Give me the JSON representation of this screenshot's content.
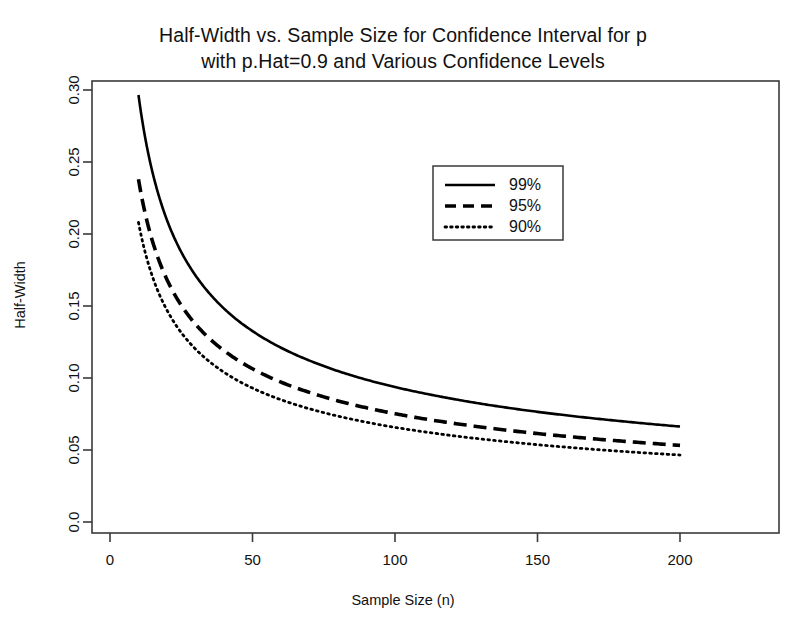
{
  "chart_data": {
    "type": "line",
    "title_line1": "Half-Width vs. Sample Size for Confidence Interval for p",
    "title_line2": "with p.Hat=0.9 and Various Confidence Levels",
    "xlabel": "Sample Size (n)",
    "ylabel": "Half-Width",
    "xlim": [
      0,
      210
    ],
    "ylim": [
      0.0,
      0.31
    ],
    "grid": false,
    "legend_position": "top-center-right",
    "xticks": [
      0,
      50,
      100,
      150,
      200
    ],
    "xticklabels": [
      "0",
      "50",
      "100",
      "150",
      "200"
    ],
    "yticks": [
      0.0,
      0.05,
      0.1,
      0.15,
      0.2,
      0.25,
      0.3
    ],
    "yticklabels": [
      "0.0",
      "0.05",
      "0.10",
      "0.15",
      "0.20",
      "0.25",
      "0.30"
    ],
    "x": [
      10,
      12,
      14,
      16,
      18,
      20,
      25,
      30,
      35,
      40,
      45,
      50,
      60,
      70,
      80,
      90,
      100,
      110,
      120,
      130,
      140,
      150,
      160,
      170,
      180,
      190,
      200
    ],
    "series": [
      {
        "name": "99%",
        "label": "99%",
        "linestyle": "solid",
        "color": "#000000",
        "z": 2.576,
        "values": [
          0.2965,
          0.2707,
          0.2506,
          0.2344,
          0.221,
          0.2096,
          0.1875,
          0.1712,
          0.1585,
          0.1482,
          0.1397,
          0.1326,
          0.121,
          0.1121,
          0.1048,
          0.0988,
          0.0937,
          0.0894,
          0.0856,
          0.0822,
          0.0792,
          0.0765,
          0.0741,
          0.0719,
          0.0699,
          0.068,
          0.0663
        ]
      },
      {
        "name": "95%",
        "label": "95%",
        "linestyle": "dashed",
        "color": "#000000",
        "z": 1.96,
        "values": [
          0.238,
          0.2173,
          0.2012,
          0.1882,
          0.1774,
          0.1683,
          0.1505,
          0.1374,
          0.1272,
          0.119,
          0.1122,
          0.1064,
          0.0971,
          0.09,
          0.0841,
          0.0793,
          0.0752,
          0.0717,
          0.0687,
          0.066,
          0.0636,
          0.0614,
          0.0595,
          0.0577,
          0.0561,
          0.0546,
          0.0532
        ]
      },
      {
        "name": "90%",
        "label": "90%",
        "linestyle": "dotted",
        "color": "#000000",
        "z": 1.645,
        "values": [
          0.208,
          0.1899,
          0.1758,
          0.1644,
          0.155,
          0.1471,
          0.1315,
          0.1201,
          0.1112,
          0.104,
          0.098,
          0.093,
          0.0849,
          0.0786,
          0.0735,
          0.0693,
          0.0657,
          0.0627,
          0.06,
          0.0577,
          0.0556,
          0.0537,
          0.052,
          0.0504,
          0.049,
          0.0477,
          0.0465
        ]
      }
    ],
    "legend": [
      {
        "label": "99%",
        "linestyle": "solid"
      },
      {
        "label": "95%",
        "linestyle": "dashed"
      },
      {
        "label": "90%",
        "linestyle": "dotted"
      }
    ],
    "annotations": []
  },
  "colors": {
    "background": "#ffffff",
    "axis": "#3a3a3a",
    "line": "#000000",
    "text": "#111111"
  }
}
